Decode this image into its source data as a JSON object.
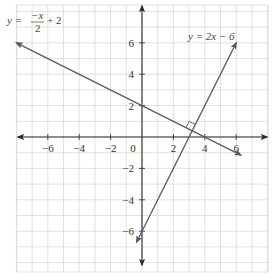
{
  "chart_data": {
    "type": "line",
    "title": "",
    "xlabel": "",
    "ylabel": "",
    "xlim": [
      -8,
      8
    ],
    "ylim": [
      -8.6,
      8.4
    ],
    "grid": true,
    "grid_step": 1,
    "x_ticks": [
      -6,
      -4,
      -2,
      2,
      4,
      6
    ],
    "y_ticks": [
      -6,
      -4,
      -2,
      2,
      4,
      6
    ],
    "x_tick_labels": [
      "−6",
      "−4",
      "−2",
      "2",
      "4",
      "6"
    ],
    "y_tick_labels": [
      "−6",
      "−4",
      "−2",
      "2",
      "4",
      "6"
    ],
    "origin_label": "0",
    "series": [
      {
        "name": "y = −x/2 + 2",
        "slope": -0.5,
        "intercept": 2,
        "x": [
          -8,
          6.3
        ],
        "y": [
          6,
          -1.15
        ],
        "arrows": "both"
      },
      {
        "name": "y = 2x − 6",
        "slope": 2,
        "intercept": -6,
        "x": [
          -0.35,
          6
        ],
        "y": [
          -6.7,
          6
        ],
        "arrows": "both"
      }
    ],
    "annotations": [
      {
        "type": "right-angle-marker",
        "at": [
          3.2,
          0.4
        ],
        "text": "perpendicular intersection"
      },
      {
        "type": "label",
        "text": "y = −x/2 + 2",
        "near": [
          -7.5,
          7
        ]
      },
      {
        "type": "label",
        "text": "y = 2x − 6",
        "near": [
          3.1,
          6.6
        ]
      }
    ]
  },
  "labels": {
    "eq1_lhs": "y = ",
    "eq1_num": "−x",
    "eq1_den": "2",
    "eq1_rhs": "+ 2",
    "eq2": "y = 2x − 6"
  },
  "colors": {
    "grid": "#d9d9d9",
    "axis": "#2a2a2a",
    "line": "#555a66",
    "text": "#333333"
  }
}
